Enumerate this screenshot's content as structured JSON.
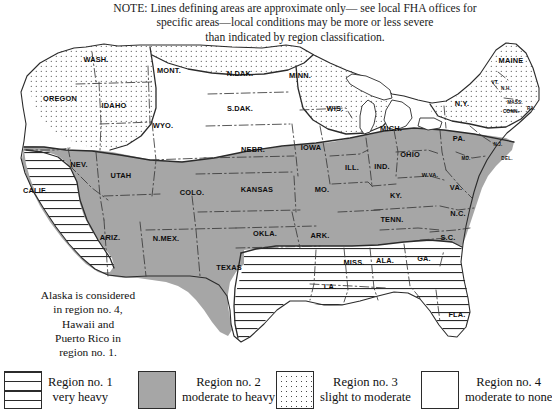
{
  "note": {
    "lines": [
      "NOTE: Lines defining areas are approximate only— see local FHA offices for",
      "specific areas—local conditions may be more or less severe",
      "than indicated by region classification."
    ]
  },
  "territory_note": {
    "lines": [
      "Alaska is considered",
      "in region no. 4,",
      "Hawaii and",
      "Puerto Rico in",
      "region no. 1."
    ]
  },
  "colors": {
    "region2_gray": "#a6a6a6",
    "outline": "#2b2b2b",
    "state_border": "#3a3a3a",
    "background": "#ffffff",
    "text": "#111111"
  },
  "legend": {
    "items": [
      {
        "pattern": "horizontal-lines",
        "line1": "Region no. 1",
        "line2": "very heavy"
      },
      {
        "pattern": "solid-gray",
        "line1": "Region no. 2",
        "line2": "moderate to heavy"
      },
      {
        "pattern": "dots",
        "line1": "Region no. 3",
        "line2": "slight to moderate"
      },
      {
        "pattern": "blank",
        "line1": "Region no. 4",
        "line2": "moderate to none"
      }
    ]
  },
  "map": {
    "states": [
      {
        "name": "WASH.",
        "x": 96,
        "y": 62,
        "size": "normal"
      },
      {
        "name": "OREGON",
        "x": 60,
        "y": 101,
        "size": "normal"
      },
      {
        "name": "IDAHO",
        "x": 114,
        "y": 108,
        "size": "normal"
      },
      {
        "name": "MONT.",
        "x": 169,
        "y": 73,
        "size": "normal"
      },
      {
        "name": "WYO.",
        "x": 163,
        "y": 128,
        "size": "normal"
      },
      {
        "name": "NEV.",
        "x": 79,
        "y": 167,
        "size": "normal"
      },
      {
        "name": "UTAH",
        "x": 121,
        "y": 178,
        "size": "normal"
      },
      {
        "name": "CALIF.",
        "x": 35,
        "y": 193,
        "size": "normal"
      },
      {
        "name": "ARIZ.",
        "x": 110,
        "y": 240,
        "size": "normal"
      },
      {
        "name": "N.MEX.",
        "x": 166,
        "y": 241,
        "size": "normal"
      },
      {
        "name": "COLO.",
        "x": 192,
        "y": 195,
        "size": "normal"
      },
      {
        "name": "N.DAK.",
        "x": 240,
        "y": 76,
        "size": "normal"
      },
      {
        "name": "S.DAK.",
        "x": 240,
        "y": 111,
        "size": "normal"
      },
      {
        "name": "NEBR.",
        "x": 253,
        "y": 152,
        "size": "normal"
      },
      {
        "name": "KANSAS",
        "x": 257,
        "y": 192,
        "size": "normal"
      },
      {
        "name": "OKLA.",
        "x": 265,
        "y": 236,
        "size": "normal"
      },
      {
        "name": "TEXAS",
        "x": 229,
        "y": 270,
        "size": "normal"
      },
      {
        "name": "MINN.",
        "x": 300,
        "y": 78,
        "size": "normal"
      },
      {
        "name": "WIS.",
        "x": 335,
        "y": 111,
        "size": "normal"
      },
      {
        "name": "IOWA",
        "x": 311,
        "y": 150,
        "size": "normal"
      },
      {
        "name": "MO.",
        "x": 322,
        "y": 192,
        "size": "normal"
      },
      {
        "name": "ARK.",
        "x": 320,
        "y": 238,
        "size": "normal"
      },
      {
        "name": "LA.",
        "x": 330,
        "y": 289,
        "size": "normal"
      },
      {
        "name": "MISS.",
        "x": 354,
        "y": 265,
        "size": "normal"
      },
      {
        "name": "ALA.",
        "x": 385,
        "y": 263,
        "size": "normal"
      },
      {
        "name": "GA.",
        "x": 424,
        "y": 261,
        "size": "normal"
      },
      {
        "name": "FLA.",
        "x": 457,
        "y": 317,
        "size": "normal"
      },
      {
        "name": "S.C.",
        "x": 448,
        "y": 240,
        "size": "normal"
      },
      {
        "name": "N.C.",
        "x": 458,
        "y": 216,
        "size": "normal"
      },
      {
        "name": "TENN.",
        "x": 392,
        "y": 222,
        "size": "normal"
      },
      {
        "name": "KY.",
        "x": 396,
        "y": 198,
        "size": "normal"
      },
      {
        "name": "ILL.",
        "x": 352,
        "y": 170,
        "size": "normal"
      },
      {
        "name": "IND.",
        "x": 382,
        "y": 169,
        "size": "normal"
      },
      {
        "name": "OHIO",
        "x": 410,
        "y": 157,
        "size": "normal"
      },
      {
        "name": "MICH.",
        "x": 391,
        "y": 131,
        "size": "normal"
      },
      {
        "name": "PA.",
        "x": 459,
        "y": 141,
        "size": "normal"
      },
      {
        "name": "W.VA.",
        "x": 430,
        "y": 177,
        "size": "sm"
      },
      {
        "name": "VA.",
        "x": 456,
        "y": 190,
        "size": "normal"
      },
      {
        "name": "MD.",
        "x": 466,
        "y": 160,
        "size": "xs"
      },
      {
        "name": "N.Y.",
        "x": 462,
        "y": 106,
        "size": "normal"
      },
      {
        "name": "MAINE",
        "x": 511,
        "y": 63,
        "size": "normal"
      },
      {
        "name": "VT.",
        "x": 495,
        "y": 84,
        "size": "xs"
      },
      {
        "name": "N.H.",
        "x": 506,
        "y": 90,
        "size": "xs"
      },
      {
        "name": "MASS.",
        "x": 515,
        "y": 104,
        "size": "xs"
      },
      {
        "name": "CONN.",
        "x": 511,
        "y": 113,
        "size": "xs"
      },
      {
        "name": "R.I.",
        "x": 531,
        "y": 110,
        "size": "xs"
      },
      {
        "name": "N.J.",
        "x": 498,
        "y": 146,
        "size": "xs"
      },
      {
        "name": "DEL.",
        "x": 507,
        "y": 160,
        "size": "xs"
      }
    ]
  }
}
